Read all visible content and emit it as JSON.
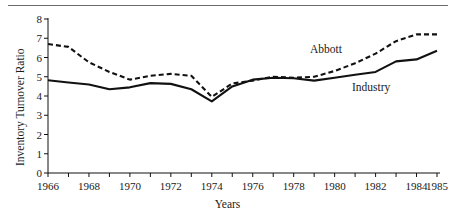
{
  "figure": {
    "has_top_rule": true,
    "background_color": "#ffffff",
    "ink_color": "#111111"
  },
  "annotations": {
    "abbott_label": "Abbott",
    "industry_label": "Industry"
  },
  "chart_data": {
    "type": "line",
    "title": "",
    "xlabel": "Years",
    "ylabel": "Inventory Turnover Ratio",
    "xlim": [
      1966,
      1985
    ],
    "ylim": [
      0,
      8
    ],
    "grid": false,
    "legend_position": "inline-annotations",
    "x": [
      1966,
      1967,
      1968,
      1969,
      1970,
      1971,
      1972,
      1973,
      1974,
      1975,
      1976,
      1977,
      1978,
      1979,
      1980,
      1981,
      1982,
      1983,
      1984,
      1985
    ],
    "x_tick_values": [
      1966,
      1967,
      1968,
      1969,
      1970,
      1971,
      1972,
      1973,
      1974,
      1975,
      1976,
      1977,
      1978,
      1979,
      1980,
      1981,
      1982,
      1983,
      1984,
      1985
    ],
    "x_tick_labels": [
      "1966",
      "",
      "1968",
      "",
      "1970",
      "",
      "1972",
      "",
      "1974",
      "",
      "1976",
      "",
      "1978",
      "",
      "1980",
      "",
      "1982",
      "",
      "1984",
      "1985"
    ],
    "y_tick_values": [
      0,
      1,
      2,
      3,
      4,
      5,
      6,
      7,
      8
    ],
    "y_tick_labels": [
      "0",
      "1",
      "2",
      "3",
      "4",
      "5",
      "6",
      "7",
      "8"
    ],
    "series": [
      {
        "name": "Abbott",
        "style": "dashed",
        "color": "#111111",
        "values": [
          6.7,
          6.55,
          5.75,
          5.25,
          4.85,
          5.05,
          5.15,
          5.05,
          3.95,
          4.65,
          4.8,
          5.0,
          4.95,
          5.0,
          5.3,
          5.7,
          6.2,
          6.85,
          7.2,
          7.2
        ]
      },
      {
        "name": "Industry",
        "style": "solid",
        "color": "#111111",
        "values": [
          4.82,
          4.7,
          4.6,
          4.35,
          4.45,
          4.67,
          4.63,
          4.35,
          3.72,
          4.5,
          4.85,
          4.95,
          4.92,
          4.8,
          4.95,
          5.1,
          5.25,
          5.8,
          5.9,
          6.35
        ]
      }
    ]
  }
}
